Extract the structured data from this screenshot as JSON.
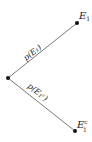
{
  "diagram": {
    "type": "probability-tree",
    "root": {
      "x": 8,
      "y": 78
    },
    "nodes": [
      {
        "id": "E1",
        "label": "E",
        "subscript": "1",
        "superscript": "",
        "x": 77,
        "y": 23
      },
      {
        "id": "E1c",
        "label": "E",
        "subscript": "1",
        "superscript": "c",
        "x": 75,
        "y": 131
      }
    ],
    "edges": [
      {
        "from": "root",
        "to": "E1",
        "label": "p(E₁)"
      },
      {
        "from": "root",
        "to": "E1c",
        "label": "p(E₁ᶜ)"
      }
    ],
    "colors": {
      "line": "#555555",
      "node": "#111111",
      "text": "#222222"
    }
  }
}
